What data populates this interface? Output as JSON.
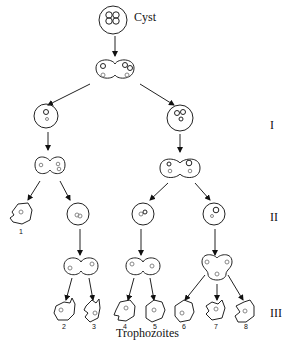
{
  "diagram": {
    "top_label": "Cyst",
    "bottom_label": "Trophozoites",
    "stages": [
      "I",
      "II",
      "III"
    ],
    "trophozoite_numbers": [
      "1",
      "2",
      "3",
      "4",
      "5",
      "6",
      "7",
      "8"
    ]
  }
}
